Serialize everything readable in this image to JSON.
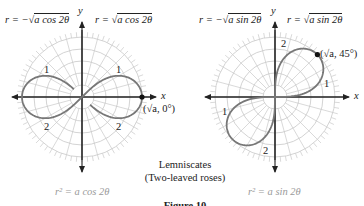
{
  "figure": {
    "caption_line1": "Lemniscates",
    "caption_line2": "(Two-leaved roses)",
    "figure_label": "Figure 10"
  },
  "left_graph": {
    "label_neg": {
      "prefix": "r = −√",
      "radicand": "a cos 2θ"
    },
    "label_pos": {
      "prefix": "r = √",
      "radicand": "a cos 2θ"
    },
    "x_axis": "x",
    "y_axis": "y",
    "loop_labels": [
      "1",
      "1",
      "2",
      "2"
    ],
    "point_label": "(√a, 0°)",
    "equation": "r² = a cos 2θ",
    "curve_color": "#777777",
    "grid_color": "#c8c8c8"
  },
  "right_graph": {
    "label_neg": {
      "prefix": "r = −√",
      "radicand": "a sin 2θ"
    },
    "label_pos": {
      "prefix": "r = √",
      "radicand": "a sin 2θ"
    },
    "x_axis": "x",
    "y_axis": "y",
    "loop_labels": [
      "2",
      "1",
      "1",
      "2"
    ],
    "point_label": "(√a, 45°)",
    "equation": "r² = a sin 2θ",
    "curve_color": "#777777",
    "grid_color": "#c8c8c8"
  }
}
